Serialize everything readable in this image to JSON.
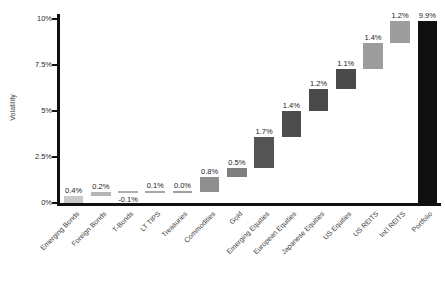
{
  "chart_data": {
    "type": "bar",
    "subtype": "waterfall",
    "title": "",
    "xlabel": "",
    "ylabel": "Volatility",
    "ylim": [
      0,
      10
    ],
    "ytick_labels": [
      "0%",
      "2.5%",
      "5%",
      "7.5%",
      "10%"
    ],
    "ytick_values": [
      0,
      2.5,
      5,
      7.5,
      10
    ],
    "grid": false,
    "legend": null,
    "value_suffix": "%",
    "categories": [
      "Emerging Bonds",
      "Foreign Bonds",
      "T-Bonds",
      "LT TIPS",
      "Treasuries",
      "Commodities",
      "Gold",
      "Emerging Equities",
      "European Equities",
      "Japanese Equities",
      "US Equities",
      "US REITS",
      "Int'l REITS",
      "Portfolio"
    ],
    "values": [
      0.4,
      0.2,
      -0.1,
      0.1,
      0.0,
      0.8,
      0.5,
      1.7,
      1.4,
      1.2,
      1.1,
      1.4,
      1.2,
      9.9
    ],
    "data_labels": [
      "0.4%",
      "0.2%",
      "-0.1%",
      "0.1%",
      "0.0%",
      "0.8%",
      "0.5%",
      "1.7%",
      "1.4%",
      "1.2%",
      "1.1%",
      "1.4%",
      "1.2%",
      "9.9%"
    ],
    "cumulative_start": [
      0.0,
      0.4,
      0.6,
      0.5,
      0.6,
      0.6,
      1.4,
      1.9,
      3.6,
      5.0,
      6.2,
      7.3,
      8.7,
      0.0
    ],
    "cumulative_end": [
      0.4,
      0.6,
      0.5,
      0.6,
      0.6,
      1.4,
      1.9,
      3.6,
      5.0,
      6.2,
      7.3,
      8.7,
      9.9,
      9.9
    ],
    "is_total": [
      false,
      false,
      false,
      false,
      false,
      false,
      false,
      false,
      false,
      false,
      false,
      false,
      false,
      true
    ],
    "bar_colors": [
      "#c9c9c9",
      "#b5b5b5",
      "#b0b0b0",
      "#a8a8a8",
      "#a0a0a0",
      "#8f8f8f",
      "#7e7e7e",
      "#545454",
      "#4d4d4d",
      "#4a4a4a",
      "#4a4a4a",
      "#9d9d9d",
      "#9d9d9d",
      "#100f10"
    ],
    "axis_color": "#111111",
    "text_color": "#2b2b2b"
  }
}
